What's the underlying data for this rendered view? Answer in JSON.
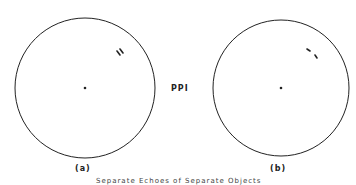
{
  "center_label": "PPI",
  "panels": [
    {
      "label": "(a)",
      "description": "Two targets shown as merged parallel echoes"
    },
    {
      "label": "(b)",
      "description": "Two targets resolved as separate echoes"
    }
  ],
  "caption": "Separate Echoes of Separate Objects",
  "colors": {
    "stroke": "#222222",
    "background": "#ffffff"
  }
}
